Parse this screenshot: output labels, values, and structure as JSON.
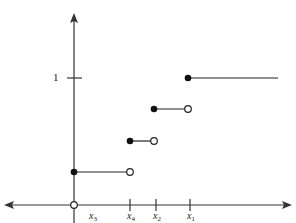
{
  "diagram": {
    "type": "step_function_cdf",
    "y_tick_label": "1",
    "x_tick_labels": [
      {
        "name": "x",
        "sub": "3"
      },
      {
        "name": "x",
        "sub": "4"
      },
      {
        "name": "x",
        "sub": "2"
      },
      {
        "name": "x",
        "sub": "1"
      }
    ],
    "steps": [
      {
        "from": "x3",
        "to": "x4",
        "level": "low",
        "left": "closed",
        "right": "open"
      },
      {
        "from": "x4",
        "to": "x2",
        "level": "mid-low",
        "left": "closed",
        "right": "open"
      },
      {
        "from": "x2",
        "to": "x1",
        "level": "mid-high",
        "left": "closed",
        "right": "open"
      },
      {
        "from": "x1",
        "to": "+inf",
        "level": "1",
        "left": "closed",
        "right": "none"
      }
    ],
    "origin_marker": "open",
    "colors": {
      "line": "#222222",
      "axis": "#333333"
    }
  }
}
